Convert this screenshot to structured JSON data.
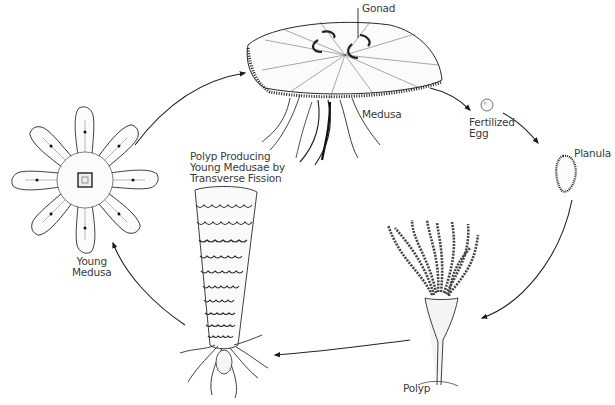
{
  "diagram": {
    "type": "life-cycle",
    "colors": {
      "background": "#ffffff",
      "ink": "#2a2a2a",
      "label_text": "#3a3a3a"
    },
    "stages": [
      {
        "id": "medusa",
        "label": "Medusa",
        "callouts": [
          {
            "label": "Gonad"
          }
        ]
      },
      {
        "id": "fertilized-egg",
        "label": "Fertilized\nEgg"
      },
      {
        "id": "planula",
        "label": "Planula"
      },
      {
        "id": "polyp",
        "label": "Polyp"
      },
      {
        "id": "strobila",
        "label": "Polyp Producing\nYoung Medusae by\nTransverse Fission"
      },
      {
        "id": "young-medusa",
        "label": "Young\nMedusa"
      }
    ],
    "arrows": [
      {
        "from": "medusa",
        "to": "fertilized-egg"
      },
      {
        "from": "fertilized-egg",
        "to": "planula"
      },
      {
        "from": "planula",
        "to": "polyp"
      },
      {
        "from": "polyp",
        "to": "strobila"
      },
      {
        "from": "strobila",
        "to": "young-medusa"
      },
      {
        "from": "young-medusa",
        "to": "medusa"
      }
    ]
  }
}
